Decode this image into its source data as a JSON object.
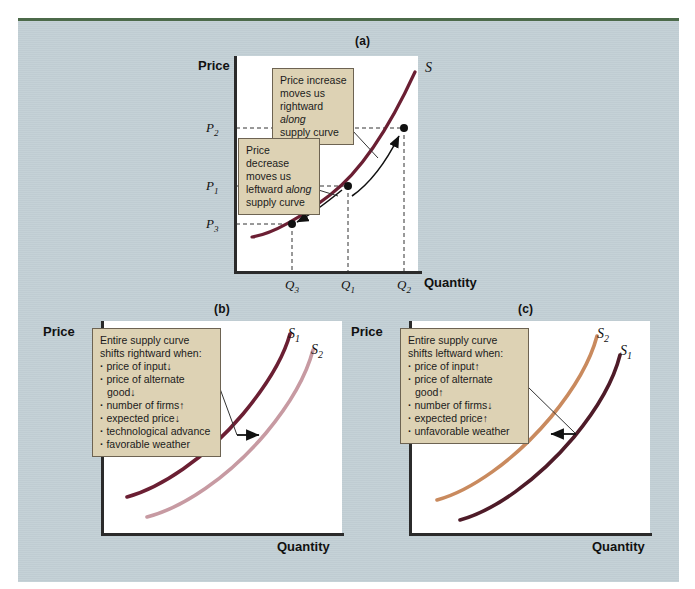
{
  "figure": {
    "background_color": "#c3d0d6",
    "top_rule_color": "#4c6a4a",
    "callout_fill": "#ddd2b4",
    "callout_border": "#6d6352",
    "curve_dark_color": "#6b1f33",
    "curve_light_color": "#c79aa2",
    "curve_tan_color": "#c98a5e"
  },
  "panel_a": {
    "caption": "(a)",
    "y_axis_title": "Price",
    "x_axis_title": "Quantity",
    "curve_label": "S",
    "y_ticks": [
      {
        "base": "P",
        "sub": "2"
      },
      {
        "base": "P",
        "sub": "1"
      },
      {
        "base": "P",
        "sub": "3"
      }
    ],
    "x_ticks": [
      {
        "base": "Q",
        "sub": "3"
      },
      {
        "base": "Q",
        "sub": "1"
      },
      {
        "base": "Q",
        "sub": "2"
      }
    ],
    "callout_increase": {
      "line1": "Price increase",
      "line2": "moves us",
      "line3a": "rightward ",
      "line3b": "along",
      "line4": "supply curve"
    },
    "callout_decrease": {
      "line1": "Price decrease",
      "line2": "moves us",
      "line3a": "leftward ",
      "line3b": "along",
      "line4": "supply curve"
    }
  },
  "panel_b": {
    "caption": "(b)",
    "y_axis_title": "Price",
    "x_axis_title": "Quantity",
    "curve_labels": [
      {
        "base": "S",
        "sub": "1"
      },
      {
        "base": "S",
        "sub": "2"
      }
    ],
    "callout": {
      "heading_line1": "Entire supply curve",
      "heading_line2": "shifts rightward when:",
      "bullets": [
        {
          "text": "price of input",
          "arrow": "down"
        },
        {
          "text": "price of alternate good",
          "arrow": "down"
        },
        {
          "text": "number of firms",
          "arrow": "up"
        },
        {
          "text": "expected price",
          "arrow": "down"
        },
        {
          "text": "technological advance",
          "arrow": "none"
        },
        {
          "text": "favorable weather",
          "arrow": "none"
        }
      ]
    }
  },
  "panel_c": {
    "caption": "(c)",
    "y_axis_title": "Price",
    "x_axis_title": "Quantity",
    "curve_labels": [
      {
        "base": "S",
        "sub": "2"
      },
      {
        "base": "S",
        "sub": "1"
      }
    ],
    "callout": {
      "heading_line1": "Entire supply curve",
      "heading_line2": "shifts leftward when:",
      "bullets": [
        {
          "text": "price of input",
          "arrow": "up"
        },
        {
          "text": "price of alternate good",
          "arrow": "up"
        },
        {
          "text": "number of firms",
          "arrow": "down"
        },
        {
          "text": "expected price",
          "arrow": "up"
        },
        {
          "text": "unfavorable weather",
          "arrow": "none"
        }
      ]
    }
  }
}
